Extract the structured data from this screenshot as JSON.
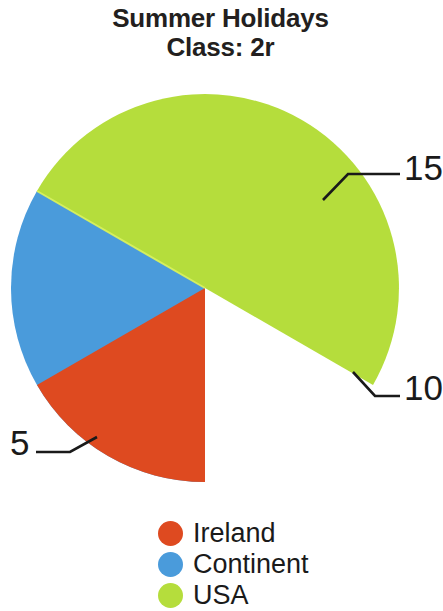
{
  "title": {
    "line1": "Summer Holidays",
    "line2": "Class: 2r"
  },
  "chart_data": {
    "type": "pie",
    "title": "Summer Holidays Class: 2r",
    "categories": [
      "Ireland",
      "Continent",
      "USA"
    ],
    "values": [
      5,
      10,
      15
    ],
    "total": 30,
    "colors": [
      "#de4a20",
      "#4a9bdb",
      "#b5dd3c"
    ],
    "data_labels": [
      "5",
      "10",
      "15"
    ],
    "legend_position": "bottom",
    "grid": false,
    "slices": [
      {
        "label": "Ireland",
        "value": 5,
        "color": "#de4a20",
        "start_angle_deg": 180,
        "sweep_deg": 60,
        "data_label": "5",
        "callout_side": "left"
      },
      {
        "label": "Continent",
        "value": 10,
        "color": "#4a9bdb",
        "start_angle_deg": 180,
        "sweep_deg": 120,
        "data_label": "10",
        "callout_side": "right"
      },
      {
        "label": "USA",
        "value": 15,
        "color": "#b5dd3c",
        "start_angle_deg": 300,
        "sweep_deg": 180,
        "data_label": "15",
        "callout_side": "right"
      }
    ]
  },
  "labels": {
    "fifteen": "15",
    "ten": "10",
    "five": "5"
  },
  "legend": {
    "items": [
      {
        "label": "Ireland",
        "color": "#de4a20"
      },
      {
        "label": "Continent",
        "color": "#4a9bdb"
      },
      {
        "label": "USA",
        "color": "#b5dd3c"
      }
    ]
  }
}
